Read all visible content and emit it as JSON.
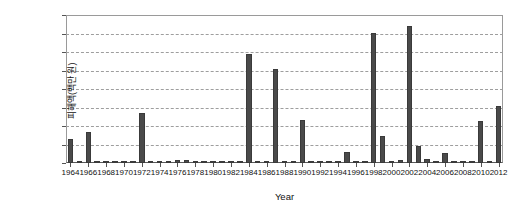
{
  "chart_data": {
    "type": "bar",
    "title": "",
    "xlabel": "Year",
    "ylabel": "피해액(백만 원)",
    "ylim": [
      0,
      80000
    ],
    "ytick_labels": [
      "0",
      "10,000",
      "20,000",
      "30,000",
      "40,000",
      "50,000",
      "60,000",
      "70,000",
      "80,000"
    ],
    "ytick_values": [
      0,
      10000,
      20000,
      30000,
      40000,
      50000,
      60000,
      70000,
      80000
    ],
    "grid": true,
    "legend": null,
    "xtick_labels": [
      "1964",
      "1966",
      "1968",
      "1970",
      "1972",
      "1974",
      "1976",
      "1978",
      "1980",
      "1982",
      "1984",
      "1986",
      "1988",
      "1990",
      "1992",
      "1994",
      "1996",
      "1998",
      "2000",
      "2002",
      "2004",
      "2006",
      "2008",
      "2010",
      "2012"
    ],
    "bar_color": "#4a4a4a",
    "x": [
      1964,
      1965,
      1966,
      1967,
      1968,
      1969,
      1970,
      1971,
      1972,
      1973,
      1974,
      1975,
      1976,
      1977,
      1978,
      1979,
      1980,
      1981,
      1982,
      1983,
      1984,
      1985,
      1986,
      1987,
      1988,
      1989,
      1990,
      1991,
      1992,
      1993,
      1994,
      1995,
      1996,
      1997,
      1998,
      1999,
      2000,
      2001,
      2002,
      2003,
      2004,
      2005,
      2006,
      2007,
      2008,
      2009,
      2010,
      2011,
      2012
    ],
    "values": [
      13000,
      200,
      16500,
      300,
      700,
      400,
      900,
      1100,
      27000,
      600,
      500,
      400,
      1700,
      1400,
      500,
      900,
      1200,
      600,
      400,
      600,
      59000,
      500,
      700,
      51000,
      900,
      500,
      23500,
      700,
      400,
      300,
      600,
      6000,
      400,
      700,
      70500,
      14500,
      800,
      1500,
      74000,
      9000,
      2000,
      700,
      5500,
      600,
      400,
      500,
      22500,
      700,
      31000
    ]
  },
  "axes": {
    "x_title": "Year",
    "y_title": "피해액(백만 원)"
  },
  "caption": {
    "text": ""
  }
}
